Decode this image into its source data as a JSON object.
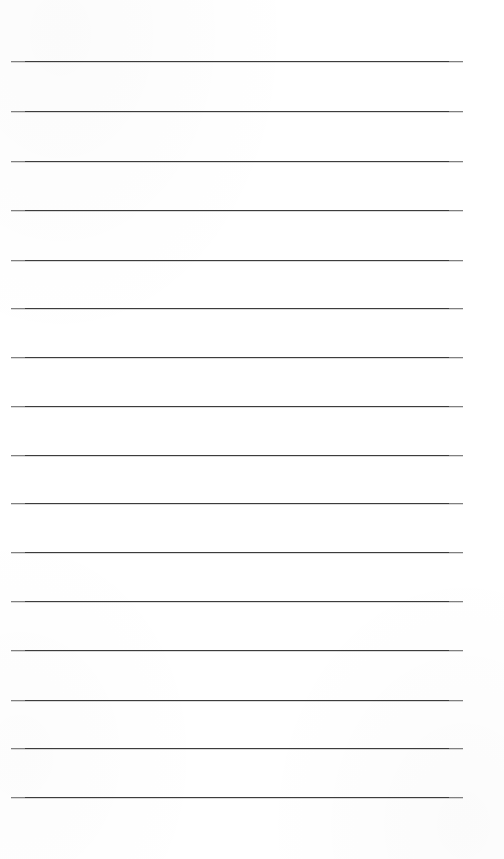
{
  "document": {
    "kind": "ruled-paper",
    "description": "Blank lined notepad page",
    "page_width": 504,
    "page_height": 859,
    "background_color": "#ffffff",
    "body_text": ""
  },
  "rules": {
    "count": 16,
    "color": "#3c3c3c",
    "thickness": 1,
    "left_x": 11,
    "right_x": 463,
    "length": 452,
    "spacing": 49,
    "first_line_y": 61,
    "last_line_y": 797,
    "top_margin": 61,
    "bottom_margin": 62,
    "y_positions": [
      61,
      111,
      161,
      210,
      260,
      308,
      357,
      406,
      455,
      503,
      552,
      601,
      650,
      700,
      748,
      797
    ]
  }
}
